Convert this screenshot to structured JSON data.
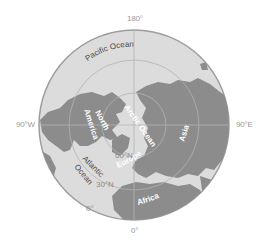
{
  "map": {
    "projection": "north-polar azimuthal",
    "colors": {
      "ocean": "#dcdcdc",
      "land": "#8c8c8c",
      "border": "#9e9e9e",
      "graticule": "#b4b4b4",
      "label_light": "#ffffff",
      "label_dark": "#4a4a4a",
      "label_grid": "#8a8a8a"
    },
    "longitude_labels": {
      "top": "180°",
      "left": "90°W",
      "right": "90°E",
      "bottom": "0°"
    },
    "latitude_labels": [
      "60°N",
      "30°N",
      "0°"
    ],
    "region_labels": {
      "pacific": "Pacific Ocean",
      "north_america_1": "North",
      "north_america_2": "America",
      "arctic": "Arctic Ocean",
      "asia": "Asia",
      "atlantic_1": "Atlantic",
      "atlantic_2": "Ocean",
      "europe": "Europe",
      "africa": "Africa"
    }
  }
}
